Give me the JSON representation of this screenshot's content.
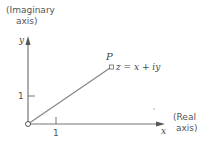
{
  "figure": {
    "type": "complex-plane",
    "y_axis": {
      "symbol": "y",
      "label_line1": "(Imaginary",
      "label_line2": "axis)",
      "tick_label": "1"
    },
    "x_axis": {
      "symbol": "x",
      "label_line1": "(Real",
      "label_line2": "axis)",
      "tick_label": "1"
    },
    "point": {
      "name": "P",
      "equation": "z = x + iy"
    },
    "colors": {
      "line": "#888888",
      "text": "#555555"
    }
  }
}
